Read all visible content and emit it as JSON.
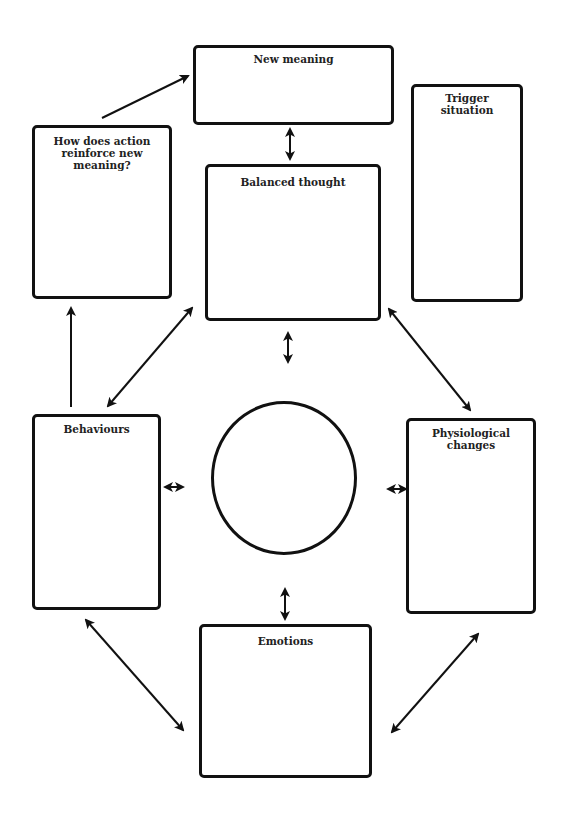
{
  "diagram": {
    "type": "cbt-thought-record-cycle",
    "boxes": {
      "new_meaning": {
        "label": "New meaning"
      },
      "how_does_action": {
        "label": "How does action reinforce new meaning?"
      },
      "trigger_situation": {
        "label": "Trigger situation"
      },
      "balanced_thought": {
        "label": "Balanced thought"
      },
      "behaviours": {
        "label": "Behaviours"
      },
      "physiological_changes": {
        "label": "Physiological changes"
      },
      "emotions": {
        "label": "Emotions"
      }
    },
    "center_circle": {
      "label": ""
    },
    "colors": {
      "stroke": "#111111",
      "background": "#ffffff",
      "text": "#222222"
    },
    "connections": [
      {
        "from": "how_does_action",
        "to": "new_meaning",
        "direction": "one-way"
      },
      {
        "from": "new_meaning",
        "to": "balanced_thought",
        "direction": "two-way"
      },
      {
        "from": "balanced_thought",
        "to": "center_circle",
        "direction": "two-way"
      },
      {
        "from": "behaviours",
        "to": "how_does_action",
        "direction": "one-way"
      },
      {
        "from": "behaviours",
        "to": "balanced_thought",
        "direction": "two-way"
      },
      {
        "from": "balanced_thought",
        "to": "physiological_changes",
        "direction": "two-way"
      },
      {
        "from": "behaviours",
        "to": "center_circle",
        "direction": "two-way"
      },
      {
        "from": "center_circle",
        "to": "physiological_changes",
        "direction": "two-way"
      },
      {
        "from": "center_circle",
        "to": "emotions",
        "direction": "two-way"
      },
      {
        "from": "behaviours",
        "to": "emotions",
        "direction": "two-way"
      },
      {
        "from": "physiological_changes",
        "to": "emotions",
        "direction": "two-way"
      }
    ]
  }
}
